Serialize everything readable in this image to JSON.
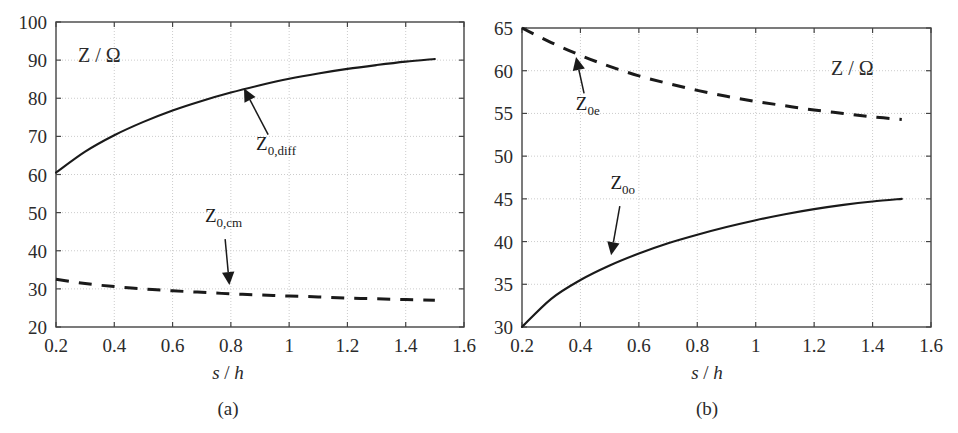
{
  "figure": {
    "background": "#ffffff",
    "axis_color": "#444444",
    "grid_color": "#cccccc",
    "curve_color": "#1a1a1a"
  },
  "panels": [
    {
      "id": "a",
      "caption": "(a)",
      "unit_label": "Z / Ω",
      "xlabel_italic_s": "s",
      "xlabel_slash": " / ",
      "xlabel_italic_h": "h",
      "xticks": [
        "0.2",
        "0.4",
        "0.6",
        "0.8",
        "1",
        "1.2",
        "1.4",
        "1.6"
      ],
      "yticks": [
        "20",
        "30",
        "40",
        "50",
        "60",
        "70",
        "80",
        "90",
        "100"
      ],
      "annotations": [
        {
          "base": "Z",
          "sub": "0,diff",
          "name": "z0diff"
        },
        {
          "base": "Z",
          "sub": "0,cm",
          "name": "z0cm"
        }
      ]
    },
    {
      "id": "b",
      "caption": "(b)",
      "unit_label": "Z / Ω",
      "xlabel_italic_s": "s",
      "xlabel_slash": " / ",
      "xlabel_italic_h": "h",
      "xticks": [
        "0.2",
        "0.4",
        "0.6",
        "0.8",
        "1",
        "1.2",
        "1.4",
        "1.6"
      ],
      "yticks": [
        "30",
        "35",
        "40",
        "45",
        "50",
        "55",
        "60",
        "65"
      ],
      "annotations": [
        {
          "base": "Z",
          "sub": "0e",
          "name": "z0e"
        },
        {
          "base": "Z",
          "sub": "0o",
          "name": "z0o"
        }
      ]
    }
  ],
  "chart_data": [
    {
      "type": "line",
      "panel": "a",
      "title": "",
      "xlabel": "s / h",
      "ylabel": "Z / Ω",
      "xlim": [
        0.2,
        1.6
      ],
      "ylim": [
        20,
        100
      ],
      "xticks": [
        0.2,
        0.4,
        0.6,
        0.8,
        1.0,
        1.2,
        1.4,
        1.6
      ],
      "yticks": [
        20,
        30,
        40,
        50,
        60,
        70,
        80,
        90,
        100
      ],
      "grid": true,
      "legend": "annotations-with-arrows",
      "x": [
        0.2,
        0.3,
        0.4,
        0.5,
        0.6,
        0.7,
        0.8,
        0.9,
        1.0,
        1.1,
        1.2,
        1.3,
        1.4,
        1.5
      ],
      "series": [
        {
          "name": "Z_0,diff",
          "style": "solid",
          "values": [
            60.5,
            66.0,
            70.3,
            73.8,
            76.8,
            79.3,
            81.5,
            83.4,
            85.1,
            86.5,
            87.7,
            88.7,
            89.6,
            90.3
          ]
        },
        {
          "name": "Z_0,cm",
          "style": "dashed",
          "values": [
            32.5,
            31.4,
            30.6,
            30.0,
            29.5,
            29.1,
            28.7,
            28.4,
            28.1,
            27.9,
            27.6,
            27.4,
            27.2,
            27.0
          ]
        }
      ]
    },
    {
      "type": "line",
      "panel": "b",
      "title": "",
      "xlabel": "s / h",
      "ylabel": "Z / Ω",
      "xlim": [
        0.2,
        1.6
      ],
      "ylim": [
        30,
        65
      ],
      "xticks": [
        0.2,
        0.4,
        0.6,
        0.8,
        1.0,
        1.2,
        1.4,
        1.6
      ],
      "yticks": [
        30,
        35,
        40,
        45,
        50,
        55,
        60,
        65
      ],
      "grid": true,
      "legend": "annotations-with-arrows",
      "x": [
        0.2,
        0.3,
        0.4,
        0.5,
        0.6,
        0.7,
        0.8,
        0.9,
        1.0,
        1.1,
        1.2,
        1.3,
        1.4,
        1.5
      ],
      "series": [
        {
          "name": "Z_0e",
          "style": "dashed",
          "values": [
            65.0,
            63.3,
            61.8,
            60.5,
            59.4,
            58.5,
            57.7,
            57.0,
            56.4,
            55.9,
            55.4,
            55.0,
            54.6,
            54.3
          ]
        },
        {
          "name": "Z_0o",
          "style": "solid",
          "values": [
            30.0,
            33.3,
            35.5,
            37.2,
            38.6,
            39.8,
            40.8,
            41.7,
            42.5,
            43.2,
            43.8,
            44.3,
            44.7,
            45.0
          ]
        }
      ]
    }
  ]
}
